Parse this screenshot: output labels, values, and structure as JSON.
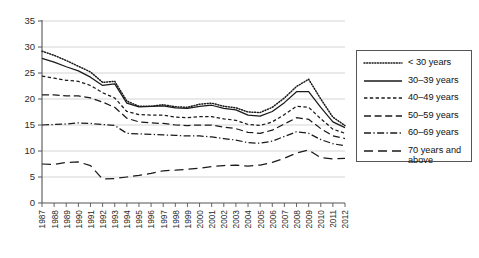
{
  "chart_data": {
    "type": "line",
    "title": "",
    "xlabel": "",
    "ylabel": "",
    "ylim": [
      0,
      35
    ],
    "ytick_step": 5,
    "yticks": [
      "0",
      "5",
      "10",
      "15",
      "20",
      "25",
      "30",
      "35"
    ],
    "grid": true,
    "legend_position": "right",
    "x": [
      "1987",
      "1988",
      "1989",
      "1990",
      "1991",
      "1992",
      "1993",
      "1994",
      "1995",
      "1996",
      "1997",
      "1998",
      "1999",
      "2000",
      "2001",
      "2002",
      "2003",
      "2004",
      "2005",
      "2006",
      "2007",
      "2008",
      "2009",
      "2010",
      "2011",
      "2012"
    ],
    "series": [
      {
        "name": "< 30 years",
        "style": "dotted",
        "values": [
          29.2,
          28.4,
          27.4,
          26.3,
          25.2,
          23.2,
          23.4,
          19.6,
          18.6,
          18.6,
          18.9,
          18.5,
          18.4,
          19.0,
          19.2,
          18.6,
          18.3,
          17.5,
          17.4,
          18.4,
          20.2,
          22.4,
          23.8,
          20.0,
          16.5,
          14.9
        ]
      },
      {
        "name": "30–39 years",
        "style": "solid",
        "values": [
          27.8,
          27.1,
          26.2,
          25.4,
          24.2,
          22.6,
          22.9,
          19.2,
          18.5,
          18.6,
          18.7,
          18.3,
          18.2,
          18.6,
          18.8,
          18.2,
          17.9,
          16.9,
          16.7,
          17.6,
          19.3,
          21.4,
          21.4,
          18.4,
          15.6,
          14.5
        ]
      },
      {
        "name": "40–49 years",
        "style": "dashed-short",
        "values": [
          24.4,
          24.0,
          23.6,
          23.4,
          22.6,
          21.2,
          20.2,
          17.6,
          17.0,
          16.9,
          16.9,
          16.5,
          16.4,
          16.6,
          16.6,
          16.2,
          15.9,
          15.1,
          14.9,
          15.6,
          17.0,
          18.6,
          18.4,
          16.2,
          14.2,
          13.4
        ]
      },
      {
        "name": "50–59 years",
        "style": "dashed-long",
        "values": [
          20.8,
          20.8,
          20.6,
          20.6,
          20.2,
          19.4,
          18.4,
          16.3,
          15.6,
          15.4,
          15.3,
          15.0,
          14.9,
          15.0,
          15.0,
          14.6,
          14.3,
          13.6,
          13.4,
          14.0,
          15.2,
          16.4,
          16.1,
          14.3,
          12.9,
          12.4
        ]
      },
      {
        "name": "60–69 years",
        "style": "dash-dot",
        "values": [
          15.0,
          15.1,
          15.2,
          15.4,
          15.3,
          15.1,
          14.9,
          13.4,
          13.3,
          13.2,
          13.1,
          13.0,
          12.9,
          12.9,
          12.7,
          12.4,
          12.1,
          11.6,
          11.5,
          11.9,
          12.8,
          13.7,
          13.4,
          12.2,
          11.4,
          11.0
        ]
      },
      {
        "name": "70 years and\nabove",
        "style": "dashed-gap",
        "values": [
          7.5,
          7.4,
          7.8,
          7.9,
          7.2,
          4.6,
          4.7,
          5.0,
          5.3,
          5.7,
          6.2,
          6.3,
          6.5,
          6.7,
          7.0,
          7.2,
          7.3,
          7.1,
          7.3,
          7.8,
          8.6,
          9.6,
          10.2,
          8.7,
          8.5,
          8.6
        ]
      }
    ]
  },
  "legend": {
    "items": [
      {
        "label": "< 30 years"
      },
      {
        "label": "30–39 years"
      },
      {
        "label": "40–49 years"
      },
      {
        "label": "50–59 years"
      },
      {
        "label": "60–69 years"
      },
      {
        "label": "70 years and\nabove"
      }
    ]
  }
}
